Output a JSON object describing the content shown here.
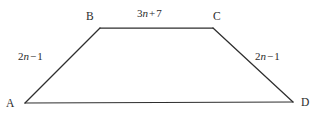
{
  "figure": {
    "kind": "trapezoid",
    "name": "trapezoid-ABCD",
    "background_color": "#ffffff",
    "stroke_color": "#2e2e2e",
    "text_color": "#2b2b2b",
    "vertices": [
      {
        "id": "A",
        "label": "A",
        "x": 25,
        "y": 103
      },
      {
        "id": "B",
        "label": "B",
        "x": 100,
        "y": 28
      },
      {
        "id": "C",
        "label": "C",
        "x": 213,
        "y": 28
      },
      {
        "id": "D",
        "label": "D",
        "x": 293,
        "y": 102
      }
    ],
    "edges": [
      {
        "from": "A",
        "to": "B",
        "label_parts": {
          "coefficient": "2",
          "variable": "n",
          "operator": "−",
          "constant": "1"
        },
        "label_text": "2n − 1"
      },
      {
        "from": "B",
        "to": "C",
        "label_parts": {
          "coefficient": "3",
          "variable": "n",
          "operator": "+",
          "constant": "7"
        },
        "label_text": "3n + 7"
      },
      {
        "from": "C",
        "to": "D",
        "label_parts": {
          "coefficient": "2",
          "variable": "n",
          "operator": "−",
          "constant": "1"
        },
        "label_text": "2n − 1"
      },
      {
        "from": "D",
        "to": "A",
        "label_parts": null,
        "label_text": ""
      }
    ]
  },
  "labels": {
    "vertex_a": "A",
    "vertex_b": "B",
    "vertex_c": "C",
    "vertex_d": "D",
    "top_coefficient": "3",
    "top_variable": "n",
    "top_operator": "+",
    "top_constant": "7",
    "left_coefficient": "2",
    "left_variable": "n",
    "left_operator": "−",
    "left_constant": "1",
    "right_coefficient": "2",
    "right_variable": "n",
    "right_operator": "−",
    "right_constant": "1"
  }
}
